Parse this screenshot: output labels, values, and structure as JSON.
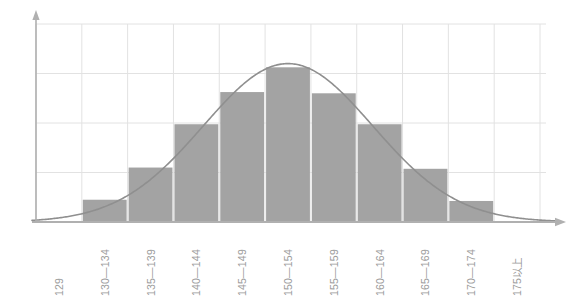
{
  "chart_data": {
    "type": "bar",
    "title": "",
    "subtitle": "",
    "xlabel": "",
    "ylabel": "",
    "grid": true,
    "legend": false,
    "legend_position": "none",
    "categories": [
      "129",
      "130—134",
      "135—139",
      "140—144",
      "145—149",
      "150—154",
      "155—159",
      "160—164",
      "165—169",
      "170—174",
      "175以上"
    ],
    "values": [
      0,
      18,
      44,
      79,
      105,
      125,
      104,
      79,
      43,
      17,
      0
    ],
    "ylim": [
      0,
      160
    ],
    "xlim_categories": 11,
    "bar_color": "#a3a3a3",
    "grid_color": "#e2e2e2",
    "axis_color": "#b0b0b0",
    "curve_color": "#8f8f8f",
    "tick_label_color": "#9b9b9b",
    "overlay_curve": {
      "name": "normal-distribution-curve",
      "type": "line",
      "mean_category_index": 5,
      "peak_value": 128,
      "std_dev_categories": 1.85
    },
    "y_gridline_values": [
      40,
      80,
      120,
      160
    ]
  },
  "axis": {
    "y_arrow": "arrow-up",
    "x_arrow": "arrow-right"
  }
}
